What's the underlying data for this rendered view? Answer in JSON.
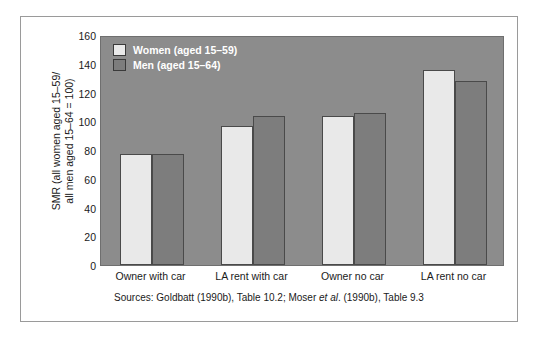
{
  "axis": {
    "ylabel_line1": "SMR (all women aged 15–59/",
    "ylabel_line2": "all men aged 15–64 = 100)"
  },
  "legend": {
    "women_label": "Women (aged 15–59)",
    "men_label": "Men (aged 15–64)"
  },
  "source": {
    "prefix": "Sources: Goldbatt (1990b), Table 10.2; Moser ",
    "italic": "et al",
    "suffix": ". (1990b), Table 9.3"
  },
  "colors": {
    "plot_background": "#8c8c8c",
    "women_bar": "#e9e9e9",
    "men_bar": "#7d7d7d",
    "bar_outline": "#4a4a4a",
    "page_background": "#ffffff",
    "text": "#1a1a1a",
    "legend_text": "#ffffff"
  },
  "chart_data": {
    "type": "bar",
    "title": "",
    "xlabel": "",
    "ylabel": "SMR (all women aged 15–59/ all men aged 15–64 = 100)",
    "categories": [
      "Owner with car",
      "LA rent with car",
      "Owner no car",
      "LA rent no car"
    ],
    "series": [
      {
        "name": "Women (aged 15–59)",
        "values": [
          77,
          97,
          104,
          136
        ]
      },
      {
        "name": "Men (aged 15–64)",
        "values": [
          77,
          104,
          106,
          128
        ]
      }
    ],
    "ylim": [
      0,
      160
    ],
    "yticks": [
      0,
      20,
      40,
      60,
      80,
      100,
      120,
      140,
      160
    ],
    "grid": false,
    "legend_position": "top-left-inside"
  }
}
